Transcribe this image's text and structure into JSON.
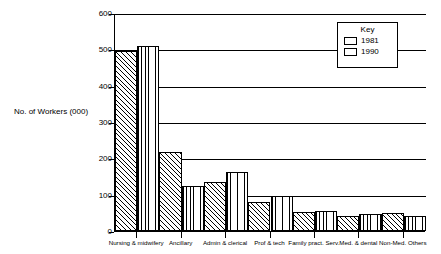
{
  "chart_data": {
    "type": "bar",
    "title": "",
    "xlabel": "",
    "ylabel": "No. of Workers (000)",
    "ylim": [
      0,
      600
    ],
    "ytick_labels": [
      "600",
      "500",
      "400",
      "300",
      "200",
      "100",
      "0"
    ],
    "ytick_values": [
      600,
      500,
      400,
      300,
      200,
      100,
      0
    ],
    "grid": true,
    "legend_position": "top-right",
    "legend_title": "Key",
    "categories": [
      "Nursing & midwifery",
      "Ancillary",
      "Admin & clerical",
      "Prof & tech",
      "Family pract. Serv.",
      "Med. & dental",
      "Non-Med. Others"
    ],
    "series": [
      {
        "name": "1981",
        "hatch": "diagonal",
        "values": [
          495,
          218,
          134,
          79,
          51,
          41,
          50
        ]
      },
      {
        "name": "1990",
        "hatch": "vertical",
        "values": [
          510,
          125,
          162,
          97,
          56,
          48,
          41
        ]
      }
    ]
  },
  "legend": {
    "title": "Key",
    "entries": [
      {
        "label": "1981",
        "pattern": "diagonal-hatch"
      },
      {
        "label": "1990",
        "pattern": "vertical-hatch"
      }
    ]
  },
  "axis": {
    "y_title": "No. of Workers (000)"
  }
}
